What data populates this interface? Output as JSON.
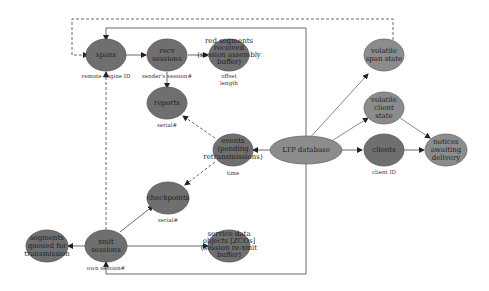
{
  "diagram": {
    "nodes": {
      "spans": {
        "lines": [
          "spans"
        ],
        "sub": [
          "remote engine ID"
        ]
      },
      "recv_sessions": {
        "lines": [
          "recv",
          "sessions"
        ],
        "sub": [
          "sender's session#"
        ]
      },
      "red_segments": {
        "lines": [
          "red segments",
          "received",
          "(session assembly",
          "buffer)"
        ],
        "sub": [
          "offset",
          "length"
        ]
      },
      "reports": {
        "lines": [
          "reports"
        ],
        "sub": [
          "serial#"
        ]
      },
      "events": {
        "lines": [
          "events",
          "(pending",
          "retransmissions)"
        ],
        "sub": [
          "time"
        ]
      },
      "ltp_database": {
        "lines": [
          "LTP database"
        ],
        "sub": []
      },
      "volatile_span_state": {
        "lines": [
          "volatile",
          "span state"
        ],
        "sub": []
      },
      "volatile_client_state": {
        "lines": [
          "volatile",
          "client",
          "state"
        ],
        "sub": []
      },
      "clients": {
        "lines": [
          "clients"
        ],
        "sub": [
          "client ID"
        ]
      },
      "notices": {
        "lines": [
          "notices",
          "awaiting",
          "delivery"
        ],
        "sub": []
      },
      "checkpoints": {
        "lines": [
          "checkpoints"
        ],
        "sub": [
          "serial#"
        ]
      },
      "segments_queued": {
        "lines": [
          "segments",
          "queued for",
          "transmission"
        ],
        "sub": []
      },
      "xmit_sessions": {
        "lines": [
          "xmit",
          "sessions"
        ],
        "sub": [
          "own session#"
        ]
      },
      "service_data": {
        "lines": [
          "service data",
          "objects [ZCOs]",
          "(session re-xmit",
          "buffer)"
        ],
        "sub": []
      }
    },
    "edges": [
      {
        "from": "spans",
        "to": "recv_sessions",
        "style": "solid"
      },
      {
        "from": "recv_sessions",
        "to": "red_segments",
        "style": "solid"
      },
      {
        "from": "recv_sessions",
        "to": "reports",
        "style": "solid"
      },
      {
        "from": "events",
        "to": "reports",
        "style": "dashed"
      },
      {
        "from": "events",
        "to": "checkpoints",
        "style": "dashed"
      },
      {
        "from": "ltp_database",
        "to": "events",
        "style": "solid"
      },
      {
        "from": "ltp_database",
        "to": "volatile_span_state",
        "style": "solid"
      },
      {
        "from": "ltp_database",
        "to": "volatile_client_state",
        "style": "solid"
      },
      {
        "from": "ltp_database",
        "to": "clients",
        "style": "solid"
      },
      {
        "from": "ltp_database",
        "to": "spans",
        "style": "solid"
      },
      {
        "from": "ltp_database",
        "to": "xmit_sessions",
        "style": "solid"
      },
      {
        "from": "volatile_client_state",
        "to": "notices",
        "style": "solid"
      },
      {
        "from": "clients",
        "to": "notices",
        "style": "solid"
      },
      {
        "from": "xmit_sessions",
        "to": "checkpoints",
        "style": "solid"
      },
      {
        "from": "xmit_sessions",
        "to": "segments_queued",
        "style": "solid"
      },
      {
        "from": "xmit_sessions",
        "to": "service_data",
        "style": "solid"
      },
      {
        "from": "xmit_sessions",
        "to": "spans",
        "style": "dashed"
      },
      {
        "from": "volatile_span_state",
        "to": "spans",
        "style": "dashed"
      }
    ]
  }
}
